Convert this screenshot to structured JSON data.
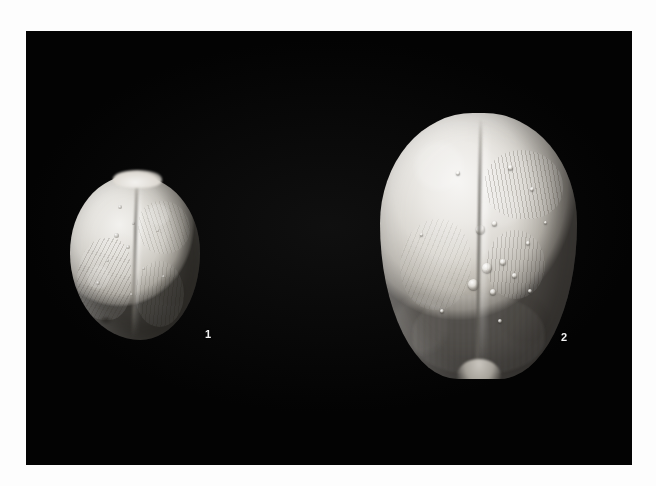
{
  "plate": {
    "kind": "scientific-specimen-plate",
    "background_color": "#030303",
    "page_color": "#fdfdfd",
    "photo_bounds": {
      "x": 26,
      "y": 31,
      "width": 606,
      "height": 434
    },
    "caption_text": "",
    "figures": [
      {
        "number": "1",
        "label": "1",
        "label_color": "#f2f2f2",
        "subject": "fossil echinoid test, small rounded specimen, apical view",
        "bounds": {
          "x": 70,
          "y": 175,
          "width": 130,
          "height": 165
        },
        "label_position": {
          "x": 205,
          "y": 329
        },
        "surface_color_light": "#f2f1ee",
        "surface_color_mid": "#cfccc5",
        "surface_color_dark": "#6d6a64",
        "features": [
          "median-sulcus",
          "ambulacral-petals",
          "tubercles",
          "marginal-notch"
        ]
      },
      {
        "number": "2",
        "label": "2",
        "label_color": "#f2f2f2",
        "subject": "fossil echinoid test, large ovate specimen with acuminate posterior, apical view",
        "bounds": {
          "x": 380,
          "y": 113,
          "width": 197,
          "height": 266
        },
        "label_position": {
          "x": 561,
          "y": 332
        },
        "surface_color_light": "#f6f5f3",
        "surface_color_mid": "#dbd8d2",
        "surface_color_dark": "#8b8780",
        "features": [
          "median-sulcus",
          "ambulacral-petals",
          "tubercles",
          "pointed-posterior-tip"
        ]
      }
    ],
    "specimen_1_tubercles": [
      {
        "x": 48,
        "y": 30,
        "d": 4
      },
      {
        "x": 62,
        "y": 47,
        "d": 3
      },
      {
        "x": 44,
        "y": 58,
        "d": 5
      },
      {
        "x": 56,
        "y": 70,
        "d": 4
      },
      {
        "x": 36,
        "y": 84,
        "d": 3
      },
      {
        "x": 72,
        "y": 92,
        "d": 3
      },
      {
        "x": 26,
        "y": 106,
        "d": 4
      },
      {
        "x": 60,
        "y": 118,
        "d": 3
      },
      {
        "x": 86,
        "y": 54,
        "d": 3
      },
      {
        "x": 92,
        "y": 100,
        "d": 3
      }
    ],
    "specimen_2_tubercles": [
      {
        "x": 96,
        "y": 112,
        "d": 9
      },
      {
        "x": 112,
        "y": 108,
        "d": 5
      },
      {
        "x": 102,
        "y": 150,
        "d": 10
      },
      {
        "x": 120,
        "y": 146,
        "d": 6
      },
      {
        "x": 88,
        "y": 166,
        "d": 11
      },
      {
        "x": 110,
        "y": 176,
        "d": 6
      },
      {
        "x": 132,
        "y": 160,
        "d": 5
      },
      {
        "x": 146,
        "y": 128,
        "d": 4
      },
      {
        "x": 76,
        "y": 58,
        "d": 4
      },
      {
        "x": 128,
        "y": 52,
        "d": 5
      },
      {
        "x": 150,
        "y": 74,
        "d": 4
      },
      {
        "x": 60,
        "y": 196,
        "d": 4
      },
      {
        "x": 118,
        "y": 206,
        "d": 4
      },
      {
        "x": 148,
        "y": 176,
        "d": 4
      },
      {
        "x": 40,
        "y": 120,
        "d": 3
      },
      {
        "x": 164,
        "y": 108,
        "d": 3
      }
    ]
  }
}
